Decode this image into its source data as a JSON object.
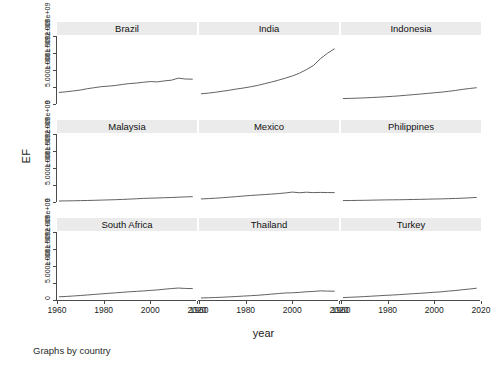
{
  "chart_data": {
    "type": "line",
    "title": "",
    "note": "Graphs by country",
    "xlabel": "year",
    "ylabel": "EF",
    "grid": false,
    "legend": "none",
    "facet_by": "country",
    "facet_layout": [
      3,
      3
    ],
    "xlim": [
      1960,
      2020
    ],
    "ylim": [
      0,
      2000000000
    ],
    "xticks": [
      1960,
      1980,
      2000,
      2020
    ],
    "xticklabels": [
      "1960",
      "1980",
      "2000",
      "2020"
    ],
    "yticks": [
      0,
      500000000,
      1000000000,
      1500000000,
      2000000000
    ],
    "yticklabels": [
      "0",
      "5.000e+08",
      "1.000e+09",
      "1.500e+09",
      "2.000e+09"
    ],
    "x": [
      1961,
      1964,
      1967,
      1970,
      1973,
      1976,
      1979,
      1982,
      1985,
      1988,
      1991,
      1994,
      1997,
      2000,
      2003,
      2006,
      2009,
      2012,
      2015,
      2018
    ],
    "series": [
      {
        "name": "Brazil",
        "row": 0,
        "col": 0,
        "values": [
          340000000,
          360000000,
          385000000,
          410000000,
          450000000,
          480000000,
          510000000,
          525000000,
          545000000,
          575000000,
          600000000,
          615000000,
          640000000,
          660000000,
          650000000,
          680000000,
          700000000,
          760000000,
          735000000,
          730000000
        ]
      },
      {
        "name": "India",
        "row": 0,
        "col": 1,
        "values": [
          300000000,
          320000000,
          345000000,
          375000000,
          405000000,
          440000000,
          470000000,
          505000000,
          545000000,
          595000000,
          645000000,
          700000000,
          760000000,
          825000000,
          905000000,
          1010000000,
          1130000000,
          1330000000,
          1490000000,
          1620000000
        ]
      },
      {
        "name": "Indonesia",
        "row": 0,
        "col": 2,
        "values": [
          160000000,
          165000000,
          172000000,
          180000000,
          190000000,
          200000000,
          212000000,
          225000000,
          240000000,
          258000000,
          275000000,
          292000000,
          312000000,
          330000000,
          348000000,
          372000000,
          398000000,
          430000000,
          455000000,
          478000000
        ]
      },
      {
        "name": "Malaysia",
        "row": 1,
        "col": 0,
        "values": [
          30000000,
          33000000,
          36000000,
          40000000,
          45000000,
          50000000,
          56000000,
          62000000,
          68000000,
          76000000,
          85000000,
          95000000,
          106000000,
          112000000,
          118000000,
          126000000,
          132000000,
          142000000,
          150000000,
          156000000
        ]
      },
      {
        "name": "Mexico",
        "row": 1,
        "col": 1,
        "values": [
          90000000,
          100000000,
          112000000,
          126000000,
          142000000,
          158000000,
          176000000,
          192000000,
          205000000,
          218000000,
          232000000,
          248000000,
          266000000,
          292000000,
          272000000,
          288000000,
          276000000,
          282000000,
          278000000,
          276000000
        ]
      },
      {
        "name": "Philippines",
        "row": 1,
        "col": 2,
        "values": [
          42000000,
          44000000,
          47000000,
          50000000,
          54000000,
          58000000,
          62000000,
          64000000,
          66000000,
          70000000,
          74000000,
          78000000,
          83000000,
          88000000,
          92000000,
          98000000,
          104000000,
          112000000,
          122000000,
          134000000
        ]
      },
      {
        "name": "South Africa",
        "row": 2,
        "col": 0,
        "values": [
          95000000,
          105000000,
          118000000,
          132000000,
          148000000,
          164000000,
          180000000,
          196000000,
          210000000,
          226000000,
          242000000,
          254000000,
          266000000,
          282000000,
          296000000,
          318000000,
          336000000,
          352000000,
          340000000,
          336000000
        ]
      },
      {
        "name": "Thailand",
        "row": 2,
        "col": 1,
        "values": [
          60000000,
          66000000,
          73000000,
          82000000,
          92000000,
          103000000,
          115000000,
          126000000,
          138000000,
          154000000,
          172000000,
          190000000,
          206000000,
          212000000,
          224000000,
          242000000,
          252000000,
          268000000,
          262000000,
          258000000
        ]
      },
      {
        "name": "Turkey",
        "row": 2,
        "col": 2,
        "values": [
          72000000,
          80000000,
          90000000,
          100000000,
          112000000,
          124000000,
          136000000,
          146000000,
          158000000,
          172000000,
          186000000,
          198000000,
          212000000,
          228000000,
          240000000,
          262000000,
          278000000,
          302000000,
          322000000,
          346000000
        ]
      }
    ]
  }
}
